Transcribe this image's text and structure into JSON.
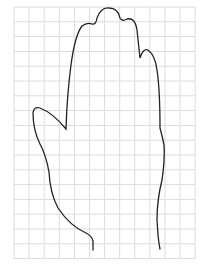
{
  "figure": {
    "grid": {
      "x0": 14,
      "y0": 7,
      "cols": 12,
      "rows": 17,
      "cell_w": 15.1,
      "cell_h": 14.8,
      "line_color": "#dcdcdc"
    },
    "outline": {
      "stroke_color": "#222222",
      "stroke_width": 1.3
    }
  }
}
